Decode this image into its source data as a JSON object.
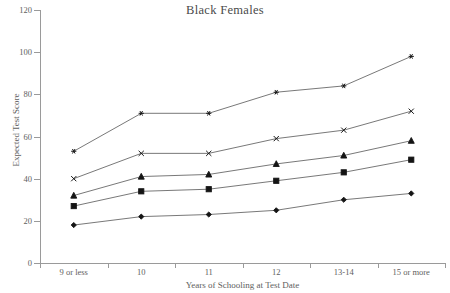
{
  "chart_data": {
    "type": "line",
    "title": "Black Females",
    "xlabel": "Years of Schooling at Test Date",
    "ylabel": "Expected Test Score",
    "categories": [
      "9 or less",
      "10",
      "11",
      "12",
      "13-14",
      "15 or more"
    ],
    "ylim": [
      0,
      120
    ],
    "ytick_labels": [
      "0",
      "20",
      "40",
      "60",
      "80",
      "100",
      "120"
    ],
    "yticks": [
      0,
      20,
      40,
      60,
      80,
      100,
      120
    ],
    "grid": false,
    "legend_position": "none",
    "series": [
      {
        "name": "series-star",
        "marker": "star",
        "values": [
          53,
          71,
          71,
          81,
          84,
          98
        ]
      },
      {
        "name": "series-x",
        "marker": "x",
        "values": [
          40,
          52,
          52,
          59,
          63,
          72
        ]
      },
      {
        "name": "series-triangle",
        "marker": "triangle",
        "values": [
          32,
          41,
          42,
          47,
          51,
          58
        ]
      },
      {
        "name": "series-square",
        "marker": "square",
        "values": [
          27,
          34,
          35,
          39,
          43,
          49
        ]
      },
      {
        "name": "series-diamond",
        "marker": "diamond",
        "values": [
          18,
          22,
          23,
          25,
          30,
          33
        ]
      }
    ]
  },
  "colors": {
    "axis": "#9a9a9a",
    "line": "#555555",
    "marker": "#141414",
    "text": "#5e5e5e",
    "title": "#4a4a4a",
    "background": "#ffffff"
  }
}
